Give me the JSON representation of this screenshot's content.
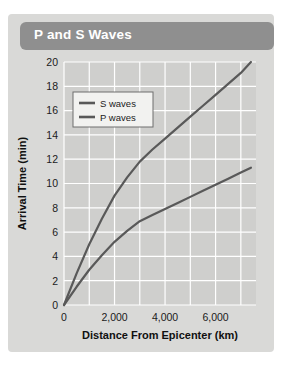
{
  "card": {
    "title": "P and S Waves",
    "banner_color": "#8f8f8f",
    "background_color": "#d9d9d7"
  },
  "chart_data": {
    "type": "line",
    "title": "P and S Waves",
    "xlabel": "Distance From Epicenter (km)",
    "ylabel": "Arrival Time (min)",
    "xlim": [
      0,
      7600
    ],
    "ylim": [
      0,
      20
    ],
    "xticks": [
      0,
      2000,
      4000,
      6000
    ],
    "xticklabels": [
      "0",
      "2,000",
      "4,000",
      "6,000"
    ],
    "yticks": [
      0,
      2,
      4,
      6,
      8,
      10,
      12,
      14,
      16,
      18,
      20
    ],
    "yticklabels": [
      "0",
      "2",
      "4",
      "6",
      "8",
      "10",
      "12",
      "14",
      "16",
      "18",
      "20"
    ],
    "grid": true,
    "grid_color": "#ffffff",
    "plot_bg": "#cfcfcd",
    "legend_position": "upper-left",
    "series": [
      {
        "name": "S waves",
        "color": "#595959",
        "x": [
          0,
          500,
          1000,
          1500,
          2000,
          2500,
          3000,
          3500,
          4000,
          4500,
          5000,
          5500,
          6000,
          6500,
          7000,
          7400
        ],
        "y": [
          0,
          2.6,
          5.0,
          7.1,
          9.0,
          10.5,
          11.8,
          12.8,
          13.7,
          14.6,
          15.5,
          16.4,
          17.3,
          18.2,
          19.1,
          20.0
        ]
      },
      {
        "name": "P waves",
        "color": "#595959",
        "x": [
          0,
          500,
          1000,
          1500,
          2000,
          2500,
          3000,
          3500,
          4000,
          4500,
          5000,
          5500,
          6000,
          6500,
          7000,
          7400
        ],
        "y": [
          0,
          1.5,
          2.9,
          4.1,
          5.2,
          6.1,
          6.9,
          7.4,
          7.9,
          8.4,
          8.9,
          9.4,
          9.9,
          10.4,
          10.9,
          11.3
        ]
      }
    ]
  }
}
